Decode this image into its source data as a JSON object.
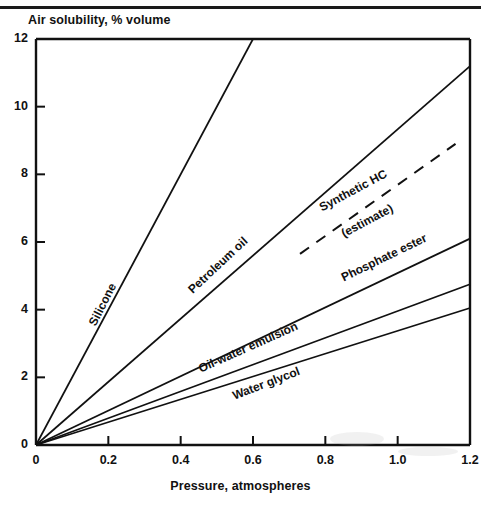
{
  "chart_data": {
    "type": "line",
    "title": "Air solubility, % volume",
    "xlabel": "Pressure, atmospheres",
    "ylabel": "Air solubility, % volume",
    "xlim": [
      0,
      1.2
    ],
    "ylim": [
      0,
      12
    ],
    "xticks": [
      "0",
      "0.2",
      "0.4",
      "0.6",
      "0.8",
      "1.0",
      "1.2"
    ],
    "xtick_values": [
      0,
      0.2,
      0.4,
      0.6,
      0.8,
      1.0,
      1.2
    ],
    "yticks": [
      "0",
      "2",
      "4",
      "6",
      "8",
      "10",
      "12"
    ],
    "ytick_values": [
      0,
      2,
      4,
      6,
      8,
      10,
      12
    ],
    "grid": false,
    "legend": "inline-labels",
    "series": [
      {
        "name": "Silicone",
        "style": "solid",
        "x": [
          0,
          0.6
        ],
        "values": [
          0,
          12
        ],
        "label": "Silicone",
        "label_x": 0.155,
        "label_y": 3.55,
        "label_angle": -63
      },
      {
        "name": "Petroleum oil",
        "style": "solid",
        "x": [
          0,
          1.2
        ],
        "values": [
          0,
          11.2
        ],
        "label": "Petroleum oil",
        "label_x": 0.425,
        "label_y": 4.55,
        "label_angle": -43
      },
      {
        "name": "Synthetic HC",
        "style": "dashed",
        "x": [
          0.73,
          1.16
        ],
        "values": [
          5.65,
          8.9
        ],
        "label": "Synthetic HC",
        "label_sub": "(estimate)",
        "label_x": 0.785,
        "label_y": 7.0,
        "label_angle": -28
      },
      {
        "name": "Phosphate ester",
        "style": "solid",
        "x": [
          0,
          1.2
        ],
        "values": [
          0,
          6.1
        ],
        "label": "Phosphate ester",
        "label_x": 0.845,
        "label_y": 4.95,
        "label_angle": -26
      },
      {
        "name": "Oil-water emulsion",
        "style": "solid",
        "x": [
          0,
          1.2
        ],
        "values": [
          0,
          4.75
        ],
        "label": "Oil-water emulsion",
        "label_x": 0.45,
        "label_y": 2.25,
        "label_angle": -24
      },
      {
        "name": "Water glycol",
        "style": "solid",
        "x": [
          0,
          1.2
        ],
        "values": [
          0,
          4.05
        ],
        "label": "Water glycol",
        "label_x": 0.545,
        "label_y": 1.45,
        "label_angle": -21
      }
    ]
  },
  "figure": {
    "title": "Air solubility, % volume",
    "xlabel": "Pressure, atmospheres"
  },
  "axis": {
    "y_labels": [
      "12",
      "10",
      "8",
      "6",
      "4",
      "2",
      "0"
    ],
    "x_labels": [
      "0",
      "0.2",
      "0.4",
      "0.6",
      "0.8",
      "1.0",
      "1.2"
    ]
  },
  "labels": {
    "silicone": "Silicone",
    "petroleum_oil": "Petroleum oil",
    "synthetic_hc": "Synthetic HC",
    "synthetic_hc_estimate": "(estimate)",
    "phosphate_ester": "Phosphate ester",
    "oil_water_emulsion": "Oil-water emulsion",
    "water_glycol": "Water glycol"
  },
  "colors": {
    "ink": "#111111",
    "background": "#ffffff"
  }
}
